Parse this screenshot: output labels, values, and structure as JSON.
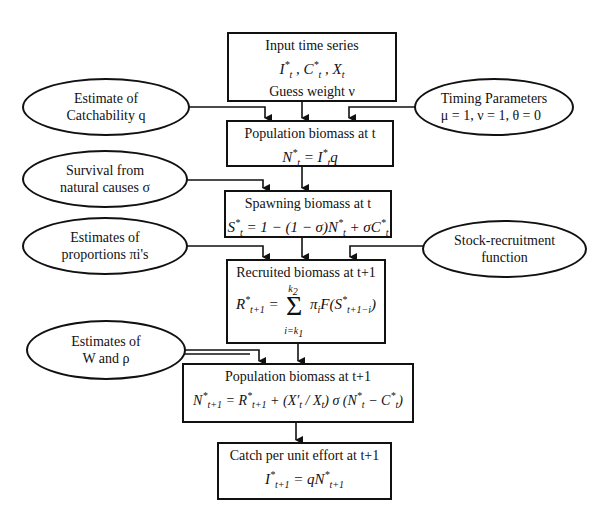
{
  "diagram": {
    "boxes": [
      {
        "id": "input",
        "title": "Input time series",
        "line2": "I*t , C*t , Xt",
        "line3": "Guess weight ν"
      },
      {
        "id": "pop_t",
        "title": "Population biomass at t",
        "equation": "N*t = I*t q"
      },
      {
        "id": "spawn_t",
        "title": "Spawning biomass at t",
        "equation": "S*t = 1 − (1 − σ) N*t + σC*t"
      },
      {
        "id": "recruit",
        "title": "Recruited biomass at t+1",
        "equation": "R*t+1 = Σ(i=k1..k2) πi F(S*t+1−i)"
      },
      {
        "id": "pop_t1",
        "title": "Population biomass at t+1",
        "equation": "N*t+1 = R*t+1 + (X′t / Xt) σ (N*t − C*t)"
      },
      {
        "id": "cpue",
        "title": "Catch per unit effort at t+1",
        "equation": "I*t+1 = qN*t+1"
      }
    ],
    "ellipses": [
      {
        "id": "catchability",
        "line1": "Estimate of",
        "line2": "Catchability q"
      },
      {
        "id": "timing",
        "line1": "Timing Parameters",
        "line2": "μ = 1,  ν = 1,  θ = 0"
      },
      {
        "id": "survival",
        "line1": "Survival from",
        "line2": "natural causes σ"
      },
      {
        "id": "proportions",
        "line1": "Estimates of",
        "line2": "proportions πi's"
      },
      {
        "id": "stock_recruit",
        "line1": "Stock-recruitment",
        "line2": "function"
      },
      {
        "id": "w_rho",
        "line1": "Estimates of",
        "line2": "W and ρ"
      }
    ],
    "labels": {
      "input_title": "Input time series",
      "input_guess": "Guess weight ν",
      "pop_t_title": "Population biomass at t",
      "spawn_t_title": "Spawning biomass at t",
      "recruit_title": "Recruited biomass at t+1",
      "pop_t1_title": "Population biomass at t+1",
      "cpue_title": "Catch per unit effort at t+1"
    }
  }
}
